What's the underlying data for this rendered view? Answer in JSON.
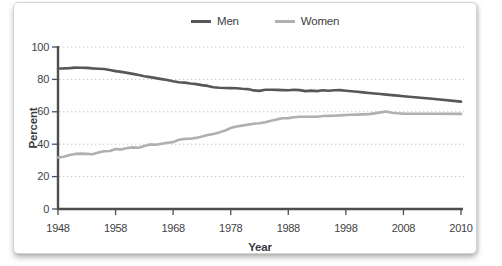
{
  "chart_data": {
    "type": "line",
    "title": "",
    "xlabel": "Year",
    "ylabel": "Percent",
    "legend_position": "top",
    "grid": "horizontal-dotted",
    "ylim": [
      0,
      100
    ],
    "y_ticks": [
      0,
      20,
      40,
      60,
      80,
      100
    ],
    "x_ticks": [
      1948,
      1958,
      1968,
      1978,
      1988,
      1998,
      2008,
      2010
    ],
    "x": [
      1948,
      1949,
      1950,
      1951,
      1952,
      1953,
      1954,
      1955,
      1956,
      1957,
      1958,
      1959,
      1960,
      1961,
      1962,
      1963,
      1964,
      1965,
      1966,
      1967,
      1968,
      1969,
      1970,
      1971,
      1972,
      1973,
      1974,
      1975,
      1976,
      1977,
      1978,
      1979,
      1980,
      1981,
      1982,
      1983,
      1984,
      1985,
      1986,
      1987,
      1988,
      1989,
      1990,
      1991,
      1992,
      1993,
      1994,
      1995,
      1996,
      1997,
      1998,
      1999,
      2000,
      2001,
      2002,
      2003,
      2004,
      2005,
      2006,
      2007,
      2008,
      2009,
      2010
    ],
    "series": [
      {
        "name": "Men",
        "color": "#56575a",
        "values": [
          86.7,
          86.8,
          87.0,
          87.3,
          87.2,
          87.1,
          86.8,
          86.6,
          86.4,
          85.8,
          85.1,
          84.6,
          84.0,
          83.4,
          82.7,
          82.0,
          81.4,
          80.8,
          80.2,
          79.6,
          78.8,
          78.3,
          78.0,
          77.5,
          77.1,
          76.5,
          76.0,
          75.1,
          74.8,
          74.7,
          74.6,
          74.5,
          74.2,
          74.0,
          73.2,
          72.9,
          73.6,
          73.6,
          73.5,
          73.4,
          73.3,
          73.6,
          73.4,
          72.8,
          73.1,
          72.8,
          73.3,
          73.0,
          73.3,
          73.4,
          73.0,
          72.7,
          72.4,
          72.0,
          71.6,
          71.3,
          71.0,
          70.6,
          70.3,
          70.0,
          69.6,
          68.0,
          66.3
        ]
      },
      {
        "name": "Women",
        "color": "#aeb0b2",
        "values": [
          31.8,
          32.3,
          33.3,
          34.0,
          34.2,
          34.0,
          33.8,
          34.8,
          35.6,
          35.8,
          37.0,
          36.8,
          37.6,
          38.0,
          37.8,
          38.9,
          39.9,
          39.6,
          40.3,
          40.9,
          41.3,
          42.7,
          43.3,
          43.4,
          43.9,
          44.7,
          45.7,
          46.3,
          47.3,
          48.4,
          50.0,
          50.9,
          51.5,
          52.1,
          52.6,
          52.9,
          53.6,
          54.5,
          55.3,
          56.0,
          56.1,
          56.6,
          57.0,
          56.9,
          57.0,
          57.0,
          57.4,
          57.5,
          57.6,
          57.8,
          58.0,
          58.2,
          58.3,
          58.4,
          58.6,
          59.0,
          59.6,
          60.2,
          59.4,
          59.1,
          58.9,
          58.8,
          58.7
        ]
      }
    ]
  }
}
